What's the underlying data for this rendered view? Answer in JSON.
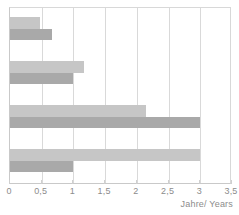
{
  "chart_data": {
    "type": "bar",
    "orientation": "horizontal",
    "title": "",
    "subtitle": "",
    "xlabel": "Jahre/ Years",
    "ylabel": "",
    "xlim": [
      0,
      3.5
    ],
    "xticks": [
      0,
      0.5,
      1,
      1.5,
      2,
      2.5,
      3,
      3.5
    ],
    "xtick_labels": [
      "0",
      "0,5",
      "1",
      "1,5",
      "2",
      "2,5",
      "3",
      "3,5"
    ],
    "categories": [
      "1",
      "2",
      "3",
      "4"
    ],
    "grid": true,
    "grid_axis": "x",
    "legend": "none",
    "series": [
      {
        "name": "light",
        "color": "#c6c6c6",
        "values": [
          0.48,
          1.17,
          2.15,
          3.0
        ]
      },
      {
        "name": "dark",
        "color": "#a9a9a9",
        "values": [
          0.67,
          1.0,
          3.0,
          1.0
        ]
      }
    ],
    "bars": [
      {
        "group": 1,
        "series": "light",
        "value": 0.48,
        "color": "#c6c6c6"
      },
      {
        "group": 1,
        "series": "dark",
        "value": 0.67,
        "color": "#a9a9a9"
      },
      {
        "group": 2,
        "series": "light",
        "value": 1.17,
        "color": "#c6c6c6"
      },
      {
        "group": 2,
        "series": "dark",
        "value": 1.0,
        "color": "#a9a9a9"
      },
      {
        "group": 3,
        "series": "light",
        "value": 2.15,
        "color": "#c6c6c6"
      },
      {
        "group": 3,
        "series": "dark",
        "value": 3.0,
        "color": "#a9a9a9"
      },
      {
        "group": 4,
        "series": "light",
        "value": 3.0,
        "color": "#c6c6c6"
      },
      {
        "group": 4,
        "series": "dark",
        "value": 1.0,
        "color": "#a9a9a9"
      }
    ]
  },
  "axis": {
    "x_title": "Jahre/ Years",
    "ticks": [
      "0",
      "0,5",
      "1",
      "1,5",
      "2",
      "2,5",
      "3",
      "3,5"
    ]
  },
  "colors": {
    "bar_light": "#c6c6c6",
    "bar_dark": "#a9a9a9",
    "grid": "#d9d9d9",
    "axis_text": "#8c8c8c",
    "background": "#ffffff"
  }
}
